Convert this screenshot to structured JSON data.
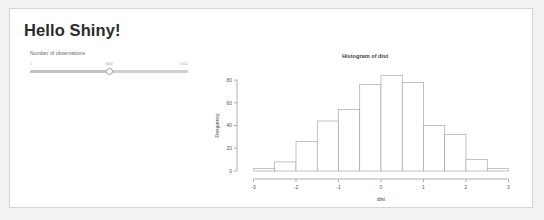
{
  "app": {
    "title": "Hello Shiny!"
  },
  "sidebar": {
    "slider": {
      "label": "Number of observations",
      "min_label": "1",
      "max_label": "1000",
      "value_label": "500",
      "value": 500,
      "min": 1,
      "max": 1000,
      "fill_percent": 50
    }
  },
  "chart_data": {
    "type": "bar",
    "title": "Histogram of dist",
    "xlabel": "dist",
    "ylabel": "Frequency",
    "xlim": [
      -3.2,
      3.2
    ],
    "ylim": [
      0,
      88
    ],
    "xticks": [
      "-3",
      "-2",
      "-1",
      "0",
      "1",
      "2",
      "3"
    ],
    "xtick_values": [
      -3,
      -2,
      -1,
      0,
      1,
      2,
      3
    ],
    "yticks": [
      "0",
      "20",
      "40",
      "60",
      "80"
    ],
    "ytick_values": [
      0,
      20,
      40,
      60,
      80
    ],
    "grid": false,
    "legend": false,
    "bin_width": 0.5,
    "bin_edges": [
      -3.0,
      -2.5,
      -2.0,
      -1.5,
      -1.0,
      -0.5,
      0.0,
      0.5,
      1.0,
      1.5,
      2.0,
      2.5,
      3.0
    ],
    "categories": [
      "-3.0 to -2.5",
      "-2.5 to -2.0",
      "-2.0 to -1.5",
      "-1.5 to -1.0",
      "-1.0 to -0.5",
      "-0.5 to 0.0",
      "0.0 to 0.5",
      "0.5 to 1.0",
      "1.0 to 1.5",
      "1.5 to 2.0",
      "2.0 to 2.5",
      "2.5 to 3.0"
    ],
    "values": [
      2,
      8,
      26,
      44,
      54,
      76,
      84,
      78,
      40,
      32,
      10,
      2
    ]
  }
}
